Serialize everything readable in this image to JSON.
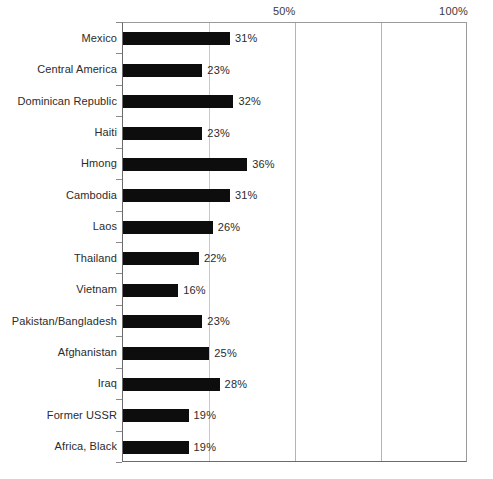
{
  "chart_data": {
    "type": "bar",
    "orientation": "horizontal",
    "title": "",
    "subtitle": "",
    "xlabel": "",
    "ylabel": "",
    "xlim": [
      0,
      100
    ],
    "grid": true,
    "legend": null,
    "x_tick_labels": [
      "50%",
      "100%"
    ],
    "x_tick_values": [
      50,
      100
    ],
    "gridline_values": [
      25,
      50,
      75,
      100
    ],
    "value_suffix": "%",
    "categories": [
      "Mexico",
      "Central America",
      "Dominican Republic",
      "Haiti",
      "Hmong",
      "Cambodia",
      "Laos",
      "Thailand",
      "Vietnam",
      "Pakistan/Bangladesh",
      "Afghanistan",
      "Iraq",
      "Former USSR",
      "Africa, Black"
    ],
    "values": [
      31,
      23,
      32,
      23,
      36,
      31,
      26,
      22,
      16,
      23,
      25,
      28,
      19,
      19
    ],
    "value_labels": [
      "31%",
      "23%",
      "32%",
      "23%",
      "36%",
      "31%",
      "26%",
      "22%",
      "16%",
      "23%",
      "25%",
      "28%",
      "19%",
      "19%"
    ],
    "bar_color": "#0d0d0d",
    "gridline_color": "#b4b4b4",
    "axis_color": "#6b6b6b",
    "background_color": "#ffffff"
  }
}
